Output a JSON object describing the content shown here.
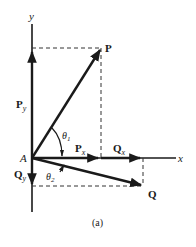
{
  "figure": {
    "caption": "(a)",
    "axes": {
      "x_label": "x",
      "y_label": "y",
      "origin_label": "A"
    },
    "vectors": [
      {
        "name": "P",
        "label": "P",
        "components": {
          "x": "P",
          "x_sub": "x",
          "y": "P",
          "y_sub": "y"
        }
      },
      {
        "name": "Q",
        "label": "Q",
        "components": {
          "x": "Q",
          "x_sub": "x",
          "y": "Q",
          "y_sub": "y"
        }
      }
    ],
    "angles": [
      {
        "label": "θ",
        "sub": "1"
      },
      {
        "label": "θ",
        "sub": "2"
      }
    ],
    "colors": {
      "ink": "#1a1a1a",
      "background": "#ffffff"
    }
  }
}
